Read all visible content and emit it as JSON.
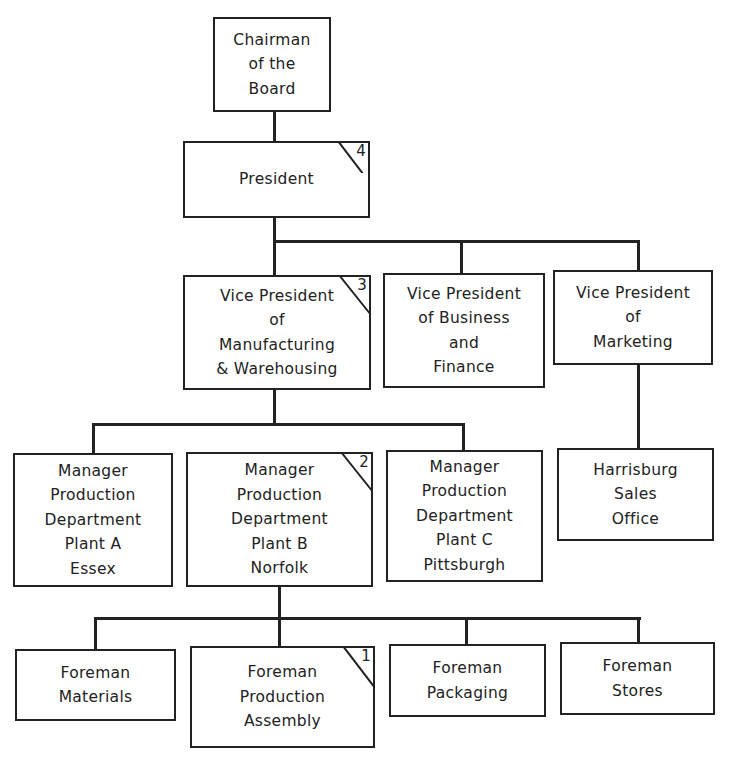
{
  "diagram": {
    "type": "organization-chart",
    "nodes": {
      "chairman": {
        "lines": [
          "Chairman",
          "of the",
          "Board"
        ]
      },
      "president": {
        "lines": [
          "President"
        ],
        "marker": "4"
      },
      "vp_manufacturing": {
        "lines": [
          "Vice President",
          "of",
          "Manufacturing",
          "& Warehousing"
        ],
        "marker": "3"
      },
      "vp_business": {
        "lines": [
          "Vice President",
          "of Business",
          "and",
          "Finance"
        ]
      },
      "vp_marketing": {
        "lines": [
          "Vice President",
          "of",
          "Marketing"
        ]
      },
      "mgr_plant_a": {
        "lines": [
          "Manager",
          "Production",
          "Department",
          "Plant A",
          "Essex"
        ]
      },
      "mgr_plant_b": {
        "lines": [
          "Manager",
          "Production",
          "Department",
          "Plant B",
          "Norfolk"
        ],
        "marker": "2"
      },
      "mgr_plant_c": {
        "lines": [
          "Manager",
          "Production",
          "Department",
          "Plant C",
          "Pittsburgh"
        ]
      },
      "harrisburg": {
        "lines": [
          "Harrisburg",
          "Sales",
          "Office"
        ]
      },
      "foreman_materials": {
        "lines": [
          "Foreman",
          "Materials"
        ]
      },
      "foreman_assembly": {
        "lines": [
          "Foreman",
          "Production",
          "Assembly"
        ],
        "marker": "1"
      },
      "foreman_packaging": {
        "lines": [
          "Foreman",
          "Packaging"
        ]
      },
      "foreman_stores": {
        "lines": [
          "Foreman",
          "Stores"
        ]
      }
    },
    "edges": [
      [
        "chairman",
        "president"
      ],
      [
        "president",
        "vp_manufacturing"
      ],
      [
        "president",
        "vp_business"
      ],
      [
        "president",
        "vp_marketing"
      ],
      [
        "vp_manufacturing",
        "mgr_plant_a"
      ],
      [
        "vp_manufacturing",
        "mgr_plant_b"
      ],
      [
        "vp_manufacturing",
        "mgr_plant_c"
      ],
      [
        "vp_marketing",
        "harrisburg"
      ],
      [
        "mgr_plant_b",
        "foreman_materials"
      ],
      [
        "mgr_plant_b",
        "foreman_assembly"
      ],
      [
        "mgr_plant_b",
        "foreman_packaging"
      ],
      [
        "mgr_plant_b",
        "foreman_stores"
      ]
    ]
  }
}
